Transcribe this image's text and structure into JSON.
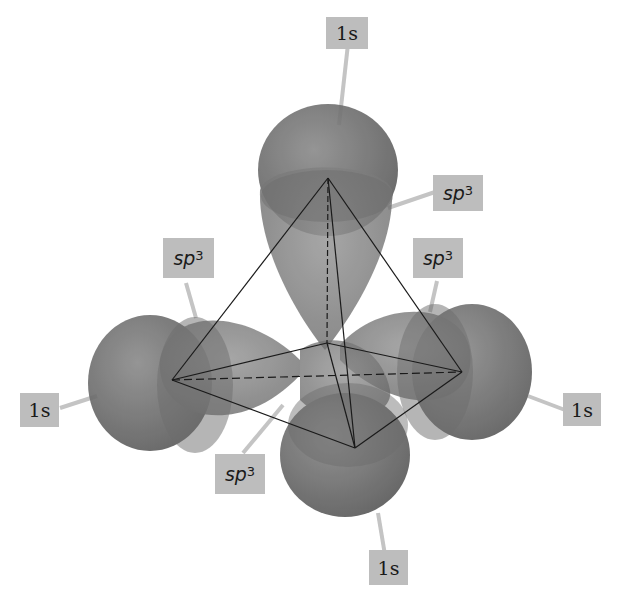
{
  "diagram": {
    "colors": {
      "orbital": "#6e6e6e",
      "label_bg": "#bdbdbd",
      "leader": "#c4c4c4",
      "edge": "#1a1a1a"
    },
    "labels": [
      {
        "id": "top-1s",
        "text": "1s",
        "type": "s"
      },
      {
        "id": "top-sp3",
        "text": "sp",
        "sup": "3",
        "type": "sp"
      },
      {
        "id": "left-sp3",
        "text": "sp",
        "sup": "3",
        "type": "sp"
      },
      {
        "id": "right-sp3",
        "text": "sp",
        "sup": "3",
        "type": "sp"
      },
      {
        "id": "left-1s",
        "text": "1s",
        "type": "s"
      },
      {
        "id": "right-1s",
        "text": "1s",
        "type": "s"
      },
      {
        "id": "front-sp3",
        "text": "sp",
        "sup": "3",
        "type": "sp"
      },
      {
        "id": "bottom-1s",
        "text": "1s",
        "type": "s"
      }
    ]
  }
}
